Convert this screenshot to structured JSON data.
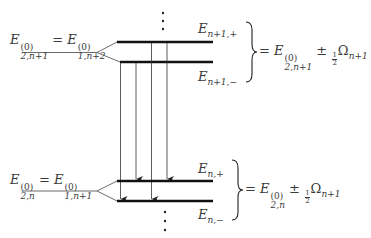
{
  "diagram": {
    "type": "energy-level-diagram",
    "upper_manifold": {
      "unperturbed_label": {
        "left": {
          "symbol": "E",
          "sup": "(0)",
          "sub": "2,n+1"
        },
        "eq": "=",
        "right": {
          "symbol": "E",
          "sup": "(0)",
          "sub": "1,n+2"
        }
      },
      "levels": [
        {
          "name": "E",
          "sub": "n+1,+"
        },
        {
          "name": "E",
          "sub": "n+1,−"
        }
      ],
      "brace_expression": {
        "eq": "=",
        "symbol": "E",
        "sup": "(0)",
        "sub": "2,n+1",
        "pm": "±",
        "frac_num": "1",
        "frac_den": "2",
        "omega": "Ω",
        "omega_sub": "n+1"
      }
    },
    "lower_manifold": {
      "unperturbed_label": {
        "left": {
          "symbol": "E",
          "sup": "(0)",
          "sub": "2,n"
        },
        "eq": "=",
        "right": {
          "symbol": "E",
          "sup": "(0)",
          "sub": "1,n+1"
        }
      },
      "levels": [
        {
          "name": "E",
          "sub": "n,+"
        },
        {
          "name": "E",
          "sub": "n,−"
        }
      ],
      "brace_expression": {
        "eq": "=",
        "symbol": "E",
        "sup": "(0)",
        "sub": "2,n",
        "pm": "±",
        "frac_num": "1",
        "frac_den": "2",
        "omega": "Ω",
        "omega_sub": "n+1"
      }
    },
    "transitions": [
      {
        "from": "n+1,−",
        "to": "n,−"
      },
      {
        "from": "n+1,−",
        "to": "n,+"
      },
      {
        "from": "n+1,+",
        "to": "n,−"
      },
      {
        "from": "n+1,+",
        "to": "n,+"
      }
    ],
    "ellipsis": "⋮",
    "colors": {
      "line": "#111111",
      "text": "#3a3a3a"
    }
  }
}
